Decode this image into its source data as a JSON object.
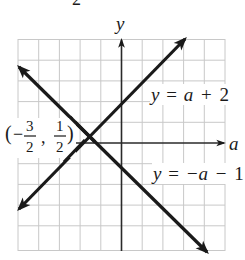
{
  "figure": {
    "top_fragment": "2",
    "axes": {
      "x_label": "a",
      "y_label": "y"
    },
    "grid": {
      "columns": 10,
      "rows": 10,
      "x_range": [
        -5,
        5
      ],
      "y_range": [
        -5,
        5
      ]
    },
    "lines": [
      {
        "name": "line-y-equals-a-plus-2",
        "equation_parts": [
          "y",
          "=",
          "a",
          "+",
          "2"
        ],
        "slope": 1,
        "intercept": 2
      },
      {
        "name": "line-y-equals-neg-a-minus-1",
        "equation_parts": [
          "y",
          "=",
          "−a",
          "−",
          "1"
        ],
        "slope": -1,
        "intercept": -1
      }
    ],
    "intersection": {
      "label_open": "(",
      "x_sign": "−",
      "x_num": "3",
      "x_den": "2",
      "sep": ",",
      "y_num": "1",
      "y_den": "2",
      "label_close": ")",
      "a": -1.5,
      "y": 0.5
    },
    "colors": {
      "ink": "#1a1a1a",
      "grid": "#c8c8c8",
      "background": "#ffffff"
    }
  }
}
